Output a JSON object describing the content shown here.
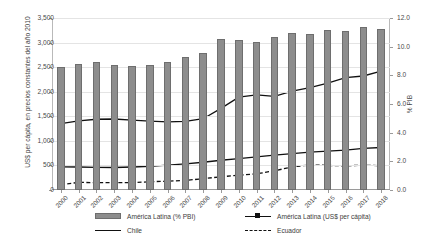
{
  "chart_data": {
    "type": "bar",
    "title": "",
    "subtitle": "",
    "xlabel": "",
    "ylabel": "US$ per cápita, en precios constantes del año 2010",
    "ylabel_secondary": "% PIB",
    "grid": true,
    "legend_position": "bottom",
    "categories": [
      "2000",
      "2001",
      "2002",
      "2003",
      "2004",
      "2005",
      "2006",
      "2007",
      "2008",
      "2009",
      "2010",
      "2011",
      "2012",
      "2013",
      "2014",
      "2015",
      "2016",
      "2017",
      "2018"
    ],
    "ylim": [
      0,
      3500
    ],
    "yticks": [
      "0",
      "500",
      "1,000",
      "1,500",
      "2,000",
      "2,500",
      "3,000",
      "3,500"
    ],
    "ylim_secondary": [
      0,
      12
    ],
    "yticks_secondary": [
      "0.0",
      "2.0",
      "4.0",
      "6.0",
      "8.0",
      "10.0",
      "12.0"
    ],
    "series": [
      {
        "name": "América Latina (% PBI)",
        "type": "bar",
        "axis": "secondary",
        "color": "#8d8d8d",
        "values": [
          8.55,
          8.8,
          8.95,
          8.75,
          8.65,
          8.7,
          8.95,
          9.3,
          9.55,
          10.55,
          10.5,
          10.35,
          10.7,
          10.95,
          10.9,
          11.15,
          11.1,
          11.4,
          11.2
        ]
      },
      {
        "name": "Chile",
        "type": "line",
        "axis": "primary",
        "color": "#111111",
        "style": "solid",
        "values": [
          1350,
          1405,
          1440,
          1445,
          1420,
          1400,
          1385,
          1395,
          1450,
          1660,
          1890,
          1935,
          1905,
          2010,
          2085,
          2175,
          2285,
          2320,
          2420
        ]
      },
      {
        "name": "América Latina (US$ per cápita)",
        "type": "line-marker",
        "axis": "primary",
        "color": "#111111",
        "style": "solid",
        "values": [
          470,
          468,
          462,
          458,
          468,
          482,
          505,
          530,
          565,
          605,
          640,
          675,
          710,
          740,
          770,
          790,
          810,
          845,
          865
        ]
      },
      {
        "name": "Ecuador",
        "type": "line",
        "axis": "primary",
        "color": "#111111",
        "style": "dashed",
        "values": [
          110,
          155,
          150,
          148,
          150,
          168,
          180,
          195,
          230,
          270,
          300,
          330,
          390,
          470,
          510,
          500,
          492,
          505,
          495
        ]
      }
    ]
  },
  "legend": {
    "items": [
      {
        "label": "América Latina (% PBI)",
        "key": "bar-swatch"
      },
      {
        "label": "América Latina (US$ per cápita)",
        "key": "line-marker-swatch"
      },
      {
        "label": "Chile",
        "key": "line-swatch"
      },
      {
        "label": "Ecuador",
        "key": "dashed-line-swatch"
      }
    ]
  }
}
